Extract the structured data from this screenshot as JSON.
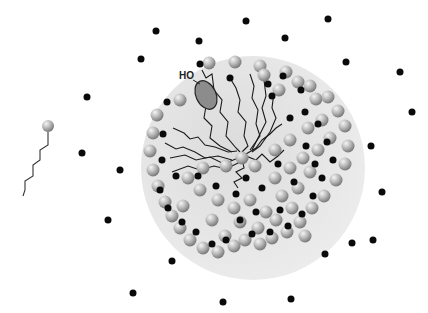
{
  "diagram": {
    "type": "micelle-schematic",
    "labels": {
      "hydroxyl": "HO"
    },
    "colors": {
      "micelle_core": "#e4e4e4",
      "headgroup_light": "#f2f2f2",
      "headgroup_dark": "#8a8a8a",
      "counterion": "#0a0a0a",
      "tail": "#1a1a1a",
      "solubilizate": "#8c8c8c"
    },
    "micelle": {
      "cx": 253,
      "cy": 168,
      "rx": 112,
      "ry": 112
    },
    "free_surfactant": {
      "head": {
        "x": 48,
        "y": 126,
        "r": 6
      },
      "tail_points": "48,132 48,145 40,150 40,160 33,165 33,176 25,181 25,190 23,196"
    },
    "solubilizate": {
      "cx": 206,
      "cy": 95,
      "rx": 10,
      "ry": 15,
      "rotate": -25
    },
    "free_counterions": [
      [
        156,
        31
      ],
      [
        246,
        21
      ],
      [
        328,
        19
      ],
      [
        199,
        41
      ],
      [
        285,
        38
      ],
      [
        141,
        59
      ],
      [
        87,
        97
      ],
      [
        346,
        62
      ],
      [
        400,
        72
      ],
      [
        412,
        112
      ],
      [
        82,
        153
      ],
      [
        120,
        170
      ],
      [
        108,
        220
      ],
      [
        371,
        146
      ],
      [
        382,
        192
      ],
      [
        373,
        240
      ],
      [
        325,
        254
      ],
      [
        172,
        261
      ],
      [
        133,
        293
      ],
      [
        223,
        302
      ],
      [
        291,
        299
      ],
      [
        352,
        243
      ]
    ],
    "headgroups": [
      [
        209,
        63
      ],
      [
        235,
        62
      ],
      [
        260,
        66
      ],
      [
        286,
        72
      ],
      [
        298,
        82
      ],
      [
        310,
        86
      ],
      [
        264,
        75
      ],
      [
        279,
        90
      ],
      [
        316,
        99
      ],
      [
        180,
        100
      ],
      [
        157,
        115
      ],
      [
        153,
        133
      ],
      [
        150,
        151
      ],
      [
        153,
        170
      ],
      [
        158,
        186
      ],
      [
        165,
        202
      ],
      [
        172,
        216
      ],
      [
        180,
        228
      ],
      [
        190,
        240
      ],
      [
        203,
        248
      ],
      [
        218,
        252
      ],
      [
        234,
        246
      ],
      [
        245,
        240
      ],
      [
        260,
        244
      ],
      [
        272,
        238
      ],
      [
        287,
        232
      ],
      [
        300,
        222
      ],
      [
        312,
        208
      ],
      [
        324,
        196
      ],
      [
        336,
        180
      ],
      [
        345,
        164
      ],
      [
        348,
        146
      ],
      [
        345,
        126
      ],
      [
        338,
        111
      ],
      [
        328,
        97
      ],
      [
        188,
        178
      ],
      [
        203,
        168
      ],
      [
        226,
        166
      ],
      [
        242,
        158
      ],
      [
        255,
        166
      ],
      [
        275,
        178
      ],
      [
        290,
        168
      ],
      [
        303,
        158
      ],
      [
        318,
        150
      ],
      [
        330,
        138
      ],
      [
        200,
        190
      ],
      [
        218,
        200
      ],
      [
        234,
        208
      ],
      [
        250,
        200
      ],
      [
        266,
        212
      ],
      [
        282,
        196
      ],
      [
        298,
        188
      ],
      [
        310,
        172
      ],
      [
        322,
        120
      ],
      [
        308,
        128
      ],
      [
        212,
        220
      ],
      [
        240,
        222
      ],
      [
        258,
        228
      ],
      [
        276,
        220
      ],
      [
        292,
        208
      ],
      [
        225,
        236
      ],
      [
        305,
        236
      ],
      [
        290,
        140
      ],
      [
        275,
        150
      ],
      [
        183,
        206
      ]
    ],
    "bound_counterions": [
      [
        200,
        64
      ],
      [
        230,
        78
      ],
      [
        268,
        84
      ],
      [
        283,
        76
      ],
      [
        301,
        90
      ],
      [
        305,
        112
      ],
      [
        318,
        124
      ],
      [
        327,
        142
      ],
      [
        333,
        160
      ],
      [
        322,
        178
      ],
      [
        313,
        196
      ],
      [
        302,
        214
      ],
      [
        288,
        226
      ],
      [
        270,
        232
      ],
      [
        252,
        234
      ],
      [
        240,
        220
      ],
      [
        226,
        240
      ],
      [
        212,
        244
      ],
      [
        196,
        232
      ],
      [
        182,
        222
      ],
      [
        168,
        208
      ],
      [
        160,
        190
      ],
      [
        162,
        160
      ],
      [
        163,
        134
      ],
      [
        167,
        102
      ],
      [
        272,
        96
      ],
      [
        290,
        118
      ],
      [
        306,
        146
      ],
      [
        294,
        182
      ],
      [
        280,
        210
      ],
      [
        256,
        212
      ],
      [
        236,
        194
      ],
      [
        216,
        186
      ],
      [
        198,
        176
      ],
      [
        176,
        176
      ],
      [
        315,
        164
      ],
      [
        262,
        188
      ],
      [
        246,
        178
      ],
      [
        278,
        164
      ]
    ],
    "tails": [
      "173,128 184,133 190,139 198,137 205,145 215,147 228,152 237,151",
      "165,143 176,149 183,147 195,152 205,158 218,156 232,160",
      "170,158 185,155 196,160 210,157 224,164 238,158",
      "172,172 188,166 200,170 214,166 226,169 240,162",
      "202,70 206,78 212,74 214,90 222,100 220,112 228,122 226,136 236,148 240,152",
      "230,78 236,88 240,100 238,112 246,122 244,136 248,146 242,152",
      "250,74 254,86 252,98 258,110 256,124 260,136 250,150",
      "264,80 266,96 262,108 266,122 258,138 252,150",
      "274,92 272,108 276,118 270,132 260,146 252,152",
      "246,154 256,148 262,140 270,134 276,128 282,124",
      "246,156 256,160 262,154 270,162 278,156 284,150",
      "242,158 244,168 236,172 242,178 234,182 238,188",
      "206,106 204,118 212,126 210,138 220,146 232,152"
    ]
  }
}
